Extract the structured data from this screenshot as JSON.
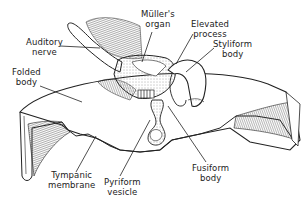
{
  "diagram": {
    "labels": {
      "auditory_nerve": [
        "Auditory",
        "nerve"
      ],
      "mullers_organ": [
        "Müller's",
        "organ"
      ],
      "elevated_process": [
        "Elevated",
        "process"
      ],
      "styliform_body": [
        "Styliform",
        "body"
      ],
      "folded_body": [
        "Folded",
        "body"
      ],
      "tympanic_membrane": [
        "Tympanic",
        "membrane"
      ],
      "pyriform_vesicle": [
        "Pyriform",
        "vesicle"
      ],
      "fusiform_body": [
        "Fusiform",
        "body"
      ]
    },
    "colors": {
      "ink": "#222222",
      "background": "#ffffff"
    }
  }
}
